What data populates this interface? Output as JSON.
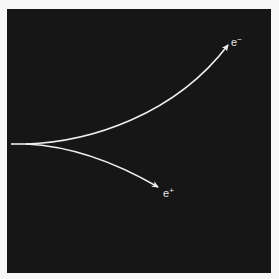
{
  "diagram": {
    "background_color": "#161616",
    "frame_color": "#f7f7f7",
    "track_color": "#eeeeee",
    "particles": [
      {
        "id": "electron",
        "symbol": "e",
        "charge": "−",
        "direction": "curves upward"
      },
      {
        "id": "positron",
        "symbol": "e",
        "charge": "+",
        "direction": "curves downward"
      }
    ]
  }
}
